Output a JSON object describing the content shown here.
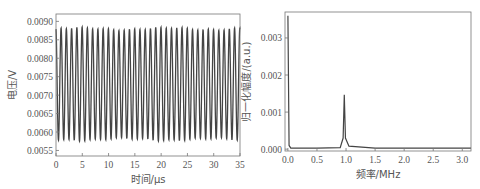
{
  "chart_data": [
    {
      "type": "line",
      "title": "",
      "xlabel": "时间/μs",
      "ylabel": "电压/V",
      "xlim": [
        0,
        35
      ],
      "ylim": [
        0.00535,
        0.0092
      ],
      "xticks": [
        "0",
        "5",
        "10",
        "15",
        "20",
        "25",
        "30",
        "35"
      ],
      "yticks": [
        "0.0055",
        "0.0060",
        "0.0065",
        "0.0070",
        "0.0075",
        "0.0080",
        "0.0085",
        "0.0090"
      ],
      "grid": false,
      "legend": null,
      "description": "Sinusoidal oscillation, ~1 MHz (~35 cycles over 35 μs), oscillating between ~0.0058 V and ~0.0088 V",
      "series": [
        {
          "name": "voltage",
          "frequency_mhz": 1.0,
          "min": 0.0058,
          "max": 0.0088,
          "cycles": 35
        }
      ],
      "color": "#444444"
    },
    {
      "type": "line",
      "title": "",
      "xlabel": "频率/MHz",
      "ylabel": "归一化幅度/(a.u.)",
      "xlim": [
        -0.05,
        3.15
      ],
      "ylim": [
        -5e-05,
        0.0037
      ],
      "xticks": [
        "0.0",
        "0.5",
        "1.0",
        "1.5",
        "2.0",
        "2.5",
        "3.0"
      ],
      "yticks": [
        "0.000",
        "0.001",
        "0.002",
        "0.003"
      ],
      "grid": false,
      "legend": null,
      "description": "Normalized FFT spectrum with DC spike at 0 and a single peak at ~0.97 MHz",
      "series": [
        {
          "name": "spectrum",
          "x": [
            0.0,
            0.02,
            0.05,
            0.5,
            0.9,
            0.95,
            0.97,
            0.99,
            1.05,
            1.5,
            2.0,
            2.5,
            3.15
          ],
          "y": [
            0.0036,
            0.0001,
            3e-05,
            3e-05,
            4e-05,
            0.0003,
            0.00147,
            0.0003,
            8e-05,
            3e-05,
            3e-05,
            3e-05,
            3e-05
          ]
        }
      ],
      "color": "#444444"
    }
  ]
}
